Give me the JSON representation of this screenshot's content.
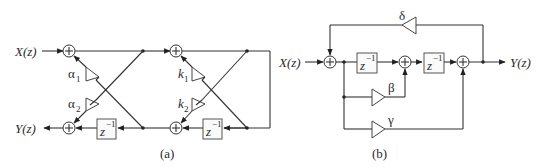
{
  "figure": {
    "panel_a": {
      "caption": "(a)",
      "input_label": "X(z)",
      "output_label": "Y(z)",
      "stage1": {
        "upper_gain": "α",
        "upper_sub": "1",
        "lower_gain": "α",
        "lower_sub": "2",
        "delay": "z",
        "delay_exp": "−1"
      },
      "stage2": {
        "upper_gain": "k",
        "upper_sub": "1",
        "lower_gain": "k",
        "lower_sub": "2",
        "delay": "z",
        "delay_exp": "−1"
      }
    },
    "panel_b": {
      "caption": "(b)",
      "input_label": "X(z)",
      "output_label": "Y(z)",
      "feedback_gain": "δ",
      "beta_gain": "β",
      "gamma_gain": "γ",
      "delay1": "z",
      "delay1_exp": "−1",
      "delay2": "z",
      "delay2_exp": "−1"
    },
    "adder_symbol": "+"
  }
}
